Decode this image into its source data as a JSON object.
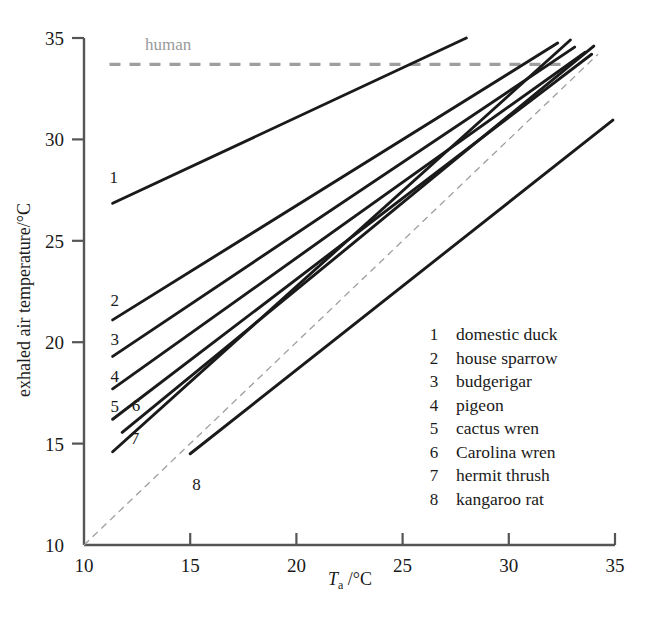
{
  "figure": {
    "background": "#ffffff",
    "ink": "#1a1a1a",
    "human_line_color": "#9e9e9e",
    "identity_line_color": "#9e9e9e"
  },
  "annotations": {
    "human_label": "human"
  },
  "legend": {
    "items": [
      {
        "num": "1",
        "label": "domestic duck"
      },
      {
        "num": "2",
        "label": "house sparrow"
      },
      {
        "num": "3",
        "label": "budgerigar"
      },
      {
        "num": "4",
        "label": "pigeon"
      },
      {
        "num": "5",
        "label": "cactus wren"
      },
      {
        "num": "6",
        "label": "Carolina wren"
      },
      {
        "num": "7",
        "label": "hermit thrush"
      },
      {
        "num": "8",
        "label": "kangaroo rat"
      }
    ]
  },
  "chart_data": {
    "type": "line",
    "title": "",
    "xlabel": "T_a /°C",
    "xlabel_parts": {
      "symbol": "T",
      "subscript": "a",
      "unit": "/°C"
    },
    "ylabel": "exhaled air temperature/°C",
    "xlim": [
      10,
      35
    ],
    "ylim": [
      10,
      35
    ],
    "xticks": [
      10,
      15,
      20,
      25,
      30,
      35
    ],
    "xtick_labels": [
      "10",
      "15",
      "20",
      "25",
      "30",
      "35"
    ],
    "yticks": [
      10,
      15,
      20,
      25,
      30,
      35
    ],
    "ytick_labels": [
      "10",
      "15",
      "20",
      "25",
      "30",
      "35"
    ],
    "grid": false,
    "legend_position": "inside-lower-right",
    "reference_lines": [
      {
        "name": "human",
        "type": "horizontal-dashed",
        "y": 33.7,
        "x_start": 11.2,
        "x_end": 32.6,
        "color": "#9e9e9e",
        "label": "human"
      },
      {
        "name": "identity",
        "type": "diagonal-dashed",
        "points": [
          [
            10,
            10
          ],
          [
            34.2,
            34.2
          ]
        ],
        "color": "#9e9e9e",
        "label": ""
      }
    ],
    "series": [
      {
        "name": "domestic duck",
        "num": "1",
        "points": [
          [
            11.35,
            26.85
          ],
          [
            28.0,
            35.0
          ]
        ],
        "label_at": [
          11.4,
          28.15
        ]
      },
      {
        "name": "house sparrow",
        "num": "2",
        "points": [
          [
            11.35,
            21.1
          ],
          [
            32.3,
            34.75
          ]
        ],
        "label_at": [
          11.45,
          22.1
        ]
      },
      {
        "name": "budgerigar",
        "num": "3",
        "points": [
          [
            11.35,
            19.3
          ],
          [
            33.1,
            34.55
          ]
        ],
        "label_at": [
          11.45,
          20.15
        ]
      },
      {
        "name": "pigeon",
        "num": "4",
        "points": [
          [
            11.35,
            17.7
          ],
          [
            33.6,
            34.3
          ]
        ],
        "label_at": [
          11.45,
          18.35
        ]
      },
      {
        "name": "cactus wren",
        "num": "5",
        "points": [
          [
            11.35,
            16.2
          ],
          [
            33.9,
            34.2
          ]
        ],
        "label_at": [
          11.45,
          16.85
        ]
      },
      {
        "name": "Carolina wren",
        "num": "6",
        "points": [
          [
            11.8,
            15.55
          ],
          [
            34.0,
            34.6
          ]
        ],
        "label_at": [
          12.45,
          16.9
        ]
      },
      {
        "name": "hermit thrush",
        "num": "7",
        "points": [
          [
            11.35,
            14.6
          ],
          [
            32.9,
            34.9
          ]
        ],
        "label_at": [
          12.4,
          15.3
        ]
      },
      {
        "name": "kangaroo rat",
        "num": "8",
        "points": [
          [
            15.0,
            14.5
          ],
          [
            34.9,
            30.95
          ]
        ],
        "label_at": [
          15.3,
          13.0
        ]
      }
    ]
  }
}
